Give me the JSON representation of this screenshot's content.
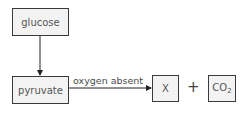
{
  "diagram": {
    "nodes": {
      "glucose": "glucose",
      "pyruvate": "pyruvate",
      "x": "X",
      "co2_main": "CO",
      "co2_sub": "2"
    },
    "edges": [
      {
        "from": "glucose",
        "to": "pyruvate",
        "label": ""
      },
      {
        "from": "pyruvate",
        "to": "X",
        "label": "oxygen absent"
      }
    ],
    "edge_label": "oxygen absent",
    "plus": "+"
  }
}
